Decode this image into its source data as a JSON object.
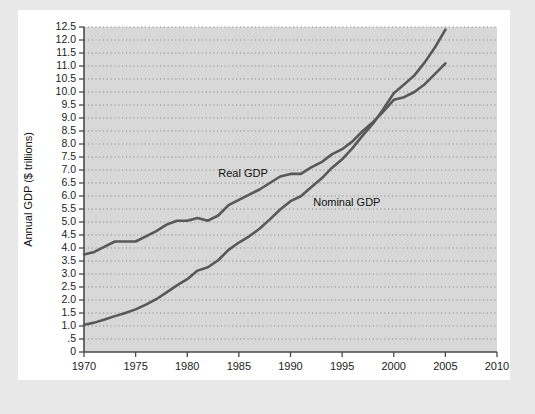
{
  "chart_data": {
    "type": "line",
    "title": "",
    "xlabel": "Year",
    "ylabel": "Annual GDP ($ trillions)",
    "xlim": [
      1970,
      2010
    ],
    "ylim": [
      0,
      12.5
    ],
    "grid": "horizontal-dotted",
    "legend": "inline-annotations",
    "xticks": [
      1970,
      1975,
      1980,
      1985,
      1990,
      1995,
      2000,
      2005,
      2010
    ],
    "xtick_labels": [
      "1970",
      "1975",
      "1980",
      "1985",
      "1990",
      "1995",
      "2000",
      "2005",
      "2010"
    ],
    "yticks": [
      0,
      0.5,
      1.0,
      1.5,
      2.0,
      2.5,
      3.0,
      3.5,
      4.0,
      4.5,
      5.0,
      5.5,
      6.0,
      6.5,
      7.0,
      7.5,
      8.0,
      8.5,
      9.0,
      9.5,
      10.0,
      10.5,
      11.0,
      11.5,
      12.0,
      12.5
    ],
    "ytick_labels": [
      "0",
      ".5",
      "1.0",
      "1.5",
      "2.0",
      "2.5",
      "3.0",
      "3.5",
      "4.0",
      "4.5",
      "5.0",
      "5.5",
      "6.0",
      "6.5",
      "7.0",
      "7.5",
      "8.0",
      "8.5",
      "9.0",
      "9.5",
      "10.0",
      "10.5",
      "11.0",
      "11.5",
      "12.0",
      "12.5"
    ],
    "series": [
      {
        "name": "Real GDP",
        "label": "Real GDP",
        "color": "#585858",
        "label_x": 1983.0,
        "label_y": 6.75,
        "x": [
          1970,
          1971,
          1972,
          1973,
          1974,
          1975,
          1976,
          1977,
          1978,
          1979,
          1980,
          1981,
          1982,
          1983,
          1984,
          1985,
          1986,
          1987,
          1988,
          1989,
          1990,
          1991,
          1992,
          1993,
          1994,
          1995,
          1996,
          1997,
          1998,
          1999,
          2000,
          2001,
          2002,
          2003,
          2004,
          2005
        ],
        "values": [
          3.75,
          3.85,
          4.05,
          4.25,
          4.25,
          4.25,
          4.45,
          4.65,
          4.9,
          5.05,
          5.05,
          5.15,
          5.05,
          5.25,
          5.65,
          5.85,
          6.05,
          6.25,
          6.5,
          6.75,
          6.85,
          6.85,
          7.1,
          7.3,
          7.6,
          7.8,
          8.1,
          8.5,
          8.85,
          9.25,
          9.7,
          9.8,
          10.0,
          10.3,
          10.7,
          11.1
        ]
      },
      {
        "name": "Nominal GDP",
        "label": "Nominal GDP",
        "color": "#585858",
        "label_x": 1992.2,
        "label_y": 5.6,
        "x": [
          1970,
          1971,
          1972,
          1973,
          1974,
          1975,
          1976,
          1977,
          1978,
          1979,
          1980,
          1981,
          1982,
          1983,
          1984,
          1985,
          1986,
          1987,
          1988,
          1989,
          1990,
          1991,
          1992,
          1993,
          1994,
          1995,
          1996,
          1997,
          1998,
          1999,
          2000,
          2001,
          2002,
          2003,
          2004,
          2005
        ],
        "values": [
          1.05,
          1.13,
          1.25,
          1.38,
          1.5,
          1.64,
          1.82,
          2.03,
          2.29,
          2.56,
          2.8,
          3.13,
          3.26,
          3.53,
          3.93,
          4.21,
          4.45,
          4.74,
          5.1,
          5.48,
          5.8,
          5.99,
          6.34,
          6.67,
          7.08,
          7.41,
          7.84,
          8.33,
          8.79,
          9.35,
          9.95,
          10.29,
          10.64,
          11.14,
          11.72,
          12.4
        ]
      }
    ]
  }
}
